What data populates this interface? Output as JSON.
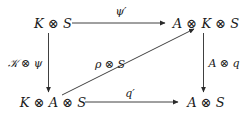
{
  "diagram": {
    "type": "commutative-diagram",
    "nodes": {
      "top_left": "K ⊗ S",
      "top_right": "A ⊗ K ⊗ S",
      "bottom_left": "K ⊗ A ⊗ S",
      "bottom_right": "A ⊗ S"
    },
    "arrows": {
      "top": {
        "from": "K ⊗ S",
        "to": "A ⊗ K ⊗ S",
        "label": "ψ′"
      },
      "left": {
        "from": "K ⊗ S",
        "to": "K ⊗ A ⊗ S",
        "label": "𝒦 ⊗ ψ"
      },
      "right": {
        "from": "A ⊗ K ⊗ S",
        "to": "A ⊗ S",
        "label": "A ⊗ q"
      },
      "bottom": {
        "from": "K ⊗ A ⊗ S",
        "to": "A ⊗ S",
        "label": "q′"
      },
      "diagonal": {
        "from": "K ⊗ A ⊗ S",
        "to": "A ⊗ K ⊗ S",
        "label": "ρ ⊗ S"
      }
    },
    "colors": {
      "ink": "#1a1a1a",
      "background": "#ffffff"
    }
  }
}
